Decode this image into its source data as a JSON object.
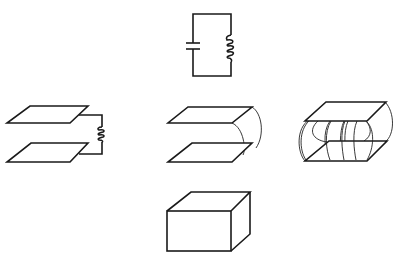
{
  "diagram": {
    "colors": {
      "line": "#1a1a1a",
      "background": "#ffffff"
    },
    "stages": [
      {
        "id": "lc-circuit",
        "label": "LC circuit (capacitor + inductor)",
        "components": [
          "capacitor",
          "inductor",
          "wire-loop"
        ]
      },
      {
        "id": "plates-with-coil",
        "label": "Parallel plates connected through a coil",
        "components": [
          "top-plate",
          "bottom-plate",
          "inductor"
        ]
      },
      {
        "id": "plates-with-strip",
        "label": "Parallel plates joined by a single curved strip",
        "components": [
          "top-plate",
          "bottom-plate",
          "curved-strips"
        ]
      },
      {
        "id": "plates-with-many-strips",
        "label": "Parallel plates joined by many curved strips",
        "components": [
          "top-plate",
          "bottom-plate",
          "curved-strips"
        ]
      },
      {
        "id": "cavity-box",
        "label": "Closed box cavity resonator",
        "components": [
          "box"
        ]
      }
    ]
  }
}
